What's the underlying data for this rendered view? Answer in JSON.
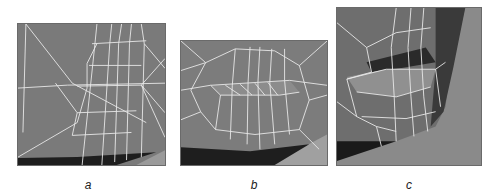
{
  "figure": {
    "panels": [
      {
        "id": "a",
        "label": "a",
        "description": "wireframe mesh of closed mouth region, front view"
      },
      {
        "id": "b",
        "label": "b",
        "description": "wireframe mesh of lips with modeled lip geometry"
      },
      {
        "id": "c",
        "label": "c",
        "description": "three-quarter view of shaded lip mesh with wireframe"
      }
    ]
  },
  "colors": {
    "background": "#ffffff",
    "mesh_surface": "#7d7d7d",
    "wire": "#e8e8e8",
    "shadow": "#1e1e1e"
  }
}
